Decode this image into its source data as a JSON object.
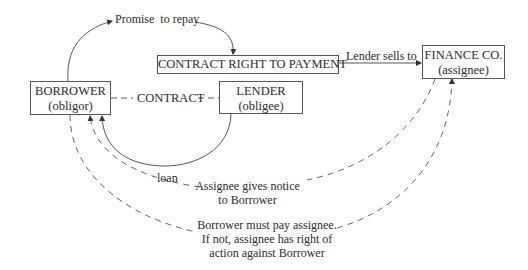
{
  "nodes": {
    "borrower": {
      "title": "BORROWER",
      "subtitle": "(obligor)"
    },
    "lender": {
      "title": "LENDER",
      "subtitle": "(obligee)"
    },
    "contract_right": {
      "title": "CONTRACT RIGHT TO PAYMENT"
    },
    "finance_co": {
      "title": "FINANCE CO.",
      "subtitle": "(assignee)"
    }
  },
  "edge_labels": {
    "promise": "Promise  to repay",
    "contract": "CONTRACT",
    "lender_sells": "Lender sells to",
    "loan": "loan",
    "notice": [
      "Assignee gives notice",
      "to Borrower"
    ],
    "must_pay": [
      "Borrower must pay assignee.",
      "If not, assignee has right of",
      "action against Borrower"
    ]
  },
  "edges": [
    {
      "from": "borrower",
      "to": "contract_right",
      "label": "promise",
      "style": "solid",
      "arrow": true
    },
    {
      "from": "borrower",
      "to": "lender",
      "label": "contract",
      "style": "dashed",
      "arrow": false
    },
    {
      "from": "contract_right",
      "to": "finance_co",
      "label": "lender_sells",
      "style": "solid",
      "arrow": true
    },
    {
      "from": "lender",
      "to": "borrower",
      "label": "loan",
      "style": "solid",
      "arrow": true
    },
    {
      "from": "finance_co",
      "to": "borrower",
      "label": "notice",
      "style": "dashed",
      "arrow": true
    },
    {
      "from": "borrower",
      "to": "finance_co",
      "label": "must_pay",
      "style": "dashed",
      "arrow": true
    }
  ]
}
